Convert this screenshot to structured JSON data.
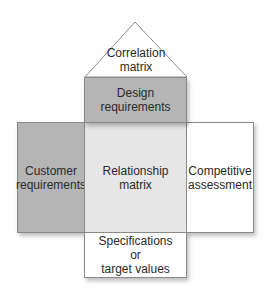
{
  "diagram": {
    "colors": {
      "roof_fill": "#ffffff",
      "design_fill": "#b5b5b5",
      "customer_fill": "#b5b5b5",
      "relationship_fill": "#e6e6e6",
      "competitive_fill": "#ffffff",
      "specifications_fill": "#ffffff",
      "border": "#8a8a8a"
    },
    "roof": {
      "label": "Correlation\nmatrix"
    },
    "design": {
      "label": "Design\nrequirements"
    },
    "customer": {
      "label": "Customer\nrequirements"
    },
    "relationship": {
      "label": "Relationship\nmatrix"
    },
    "competitive": {
      "label": "Competitive\nassessment"
    },
    "specifications": {
      "label": "Specifications\nor\ntarget values"
    }
  }
}
